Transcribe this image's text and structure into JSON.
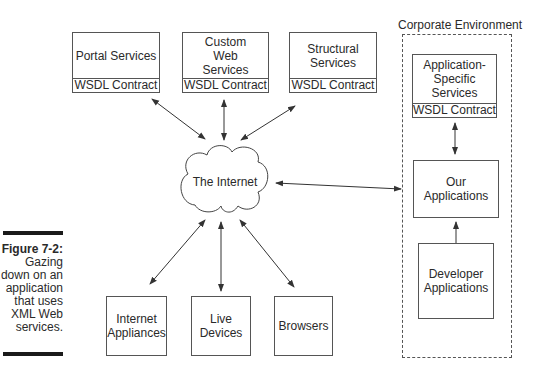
{
  "caption": {
    "figure_label": "Figure 7-2:",
    "lines": [
      "Gazing",
      "down on an",
      "application",
      "that uses",
      "XML Web",
      "services."
    ]
  },
  "top_services": [
    {
      "name": "Portal Services",
      "contract": "WSDL Contract"
    },
    {
      "name": "Custom Web Services",
      "contract": "WSDL Contract"
    },
    {
      "name": "Structural Services",
      "contract": "WSDL Contract"
    }
  ],
  "internet": {
    "label": "The Internet"
  },
  "clients": [
    {
      "name": "Internet Appliances"
    },
    {
      "name": "Live Devices"
    },
    {
      "name": "Browsers"
    }
  ],
  "corporate": {
    "title": "Corporate Environment",
    "app_specific": {
      "name": "Application-Specific Services",
      "contract": "WSDL Contract"
    },
    "our_apps": {
      "name": "Our Applications"
    },
    "developer_apps": {
      "name": "Developer Applications"
    }
  },
  "colors": {
    "stroke": "#555555",
    "text": "#2a2a2a",
    "bar": "#1a1a1a"
  }
}
